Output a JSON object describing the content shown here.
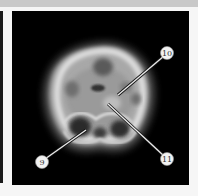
{
  "image": {
    "description": "Axial PET brain scan, grayscale, with numbered callouts",
    "background_color": "#000000",
    "callouts": [
      {
        "label": "10",
        "cx": 155,
        "cy": 42,
        "tx": 106,
        "ty": 84
      },
      {
        "label": "11",
        "cx": 155,
        "cy": 148,
        "tx": 96,
        "ty": 93
      },
      {
        "label": "9",
        "cx": 30,
        "cy": 151,
        "tx": 74,
        "ty": 119
      }
    ]
  }
}
